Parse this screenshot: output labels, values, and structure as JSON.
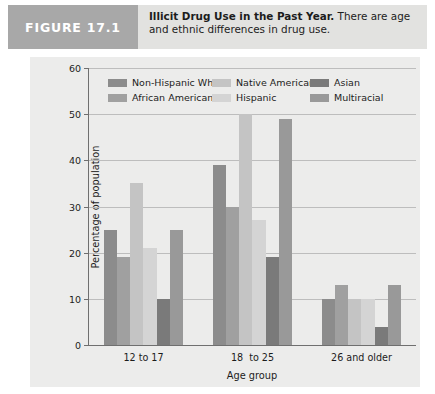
{
  "figure": {
    "number_label": "FIGURE 17.1",
    "caption_lead": "Illicit Drug Use in the Past Year.",
    "caption_rest": " There are age and ethnic differences in drug use."
  },
  "chart_data": {
    "type": "bar",
    "title": "Illicit Drug Use in the Past Year",
    "xlabel": "Age group",
    "ylabel": "Percentage of population",
    "ylim": [
      0,
      60
    ],
    "yticks": [
      0,
      10,
      20,
      30,
      40,
      50,
      60
    ],
    "grid": true,
    "legend_position": "top",
    "categories": [
      "12 to 17",
      "18  to 25",
      "26 and older"
    ],
    "series": [
      {
        "name": "Non-Hispanic White",
        "color": "#8c8c8c",
        "values": [
          25,
          39,
          10
        ]
      },
      {
        "name": "African American",
        "color": "#a0a0a0",
        "values": [
          19,
          30,
          13
        ]
      },
      {
        "name": "Native American",
        "color": "#c4c4c4",
        "values": [
          35,
          50,
          10
        ]
      },
      {
        "name": "Hispanic",
        "color": "#d4d4d4",
        "values": [
          21,
          27,
          10
        ]
      },
      {
        "name": "Asian",
        "color": "#7a7a7a",
        "values": [
          10,
          19,
          4
        ]
      },
      {
        "name": "Multiracial",
        "color": "#999999",
        "values": [
          25,
          49,
          13
        ]
      }
    ]
  }
}
